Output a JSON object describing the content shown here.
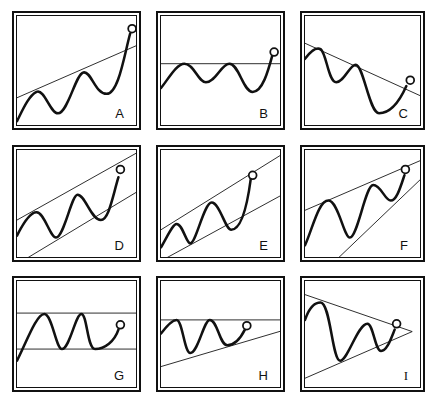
{
  "figure": {
    "colors": {
      "ink": "#111111",
      "background": "#ffffff"
    },
    "viewbox": {
      "w": 128,
      "h": 118
    },
    "panels": [
      {
        "label": "A",
        "x": 12,
        "y": 11,
        "w": 129,
        "h": 119,
        "lines": [
          {
            "x1": 0,
            "y1": 84,
            "x2": 128,
            "y2": 28
          }
        ],
        "curve": "M0,108 C6,96 12,82 20,78 C28,74 34,100 42,100 C52,100 60,60 68,58 C76,56 80,80 92,80 C104,80 110,40 116,18",
        "circle": {
          "cx": 118,
          "cy": 13,
          "r": 4
        }
      },
      {
        "label": "B",
        "x": 156,
        "y": 11,
        "w": 129,
        "h": 119,
        "lines": [
          {
            "x1": 0,
            "y1": 49,
            "x2": 128,
            "y2": 49
          }
        ],
        "curve": "M0,74 C8,64 16,49 24,49 C34,49 38,68 46,68 C56,68 62,49 70,49 C80,49 84,78 94,78 C104,78 110,56 114,41",
        "circle": {
          "cx": 116,
          "cy": 37,
          "r": 4
        }
      },
      {
        "label": "C",
        "x": 300,
        "y": 11,
        "w": 125,
        "h": 119,
        "lines": [
          {
            "x1": 0,
            "y1": 28,
            "x2": 125,
            "y2": 85
          }
        ],
        "curve": "M0,44 C6,36 12,32 16,34 C22,38 24,68 32,68 C40,68 46,50 52,50 C60,50 66,100 76,100 C86,100 96,90 104,72",
        "circle": {
          "cx": 108,
          "cy": 66,
          "r": 4
        }
      },
      {
        "label": "D",
        "x": 12,
        "y": 145,
        "w": 129,
        "h": 117,
        "lines": [
          {
            "x1": 0,
            "y1": 72,
            "x2": 128,
            "y2": 0
          },
          {
            "x1": 4,
            "y1": 115,
            "x2": 128,
            "y2": 40
          }
        ],
        "curve": "M0,88 C6,76 14,64 20,64 C28,64 34,90 40,90 C48,90 56,46 62,46 C70,46 76,72 86,72 C94,72 98,48 104,28",
        "circle": {
          "cx": 106,
          "cy": 20,
          "r": 4
        }
      },
      {
        "label": "E",
        "x": 156,
        "y": 145,
        "w": 129,
        "h": 117,
        "lines": [
          {
            "x1": 0,
            "y1": 82,
            "x2": 128,
            "y2": 2
          },
          {
            "x1": 0,
            "y1": 114,
            "x2": 128,
            "y2": 44
          }
        ],
        "curve": "M0,100 C6,90 12,76 16,76 C22,76 26,96 30,96 C36,96 44,54 52,54 C60,54 66,82 72,82 C82,82 88,60 92,30",
        "circle": {
          "cx": 94,
          "cy": 26,
          "r": 4
        }
      },
      {
        "label": "F",
        "x": 300,
        "y": 145,
        "w": 125,
        "h": 117,
        "lines": [
          {
            "x1": 0,
            "y1": 62,
            "x2": 125,
            "y2": 8
          },
          {
            "x1": 30,
            "y1": 115,
            "x2": 125,
            "y2": 24
          }
        ],
        "curve": "M0,98 C8,80 14,52 24,52 C34,52 40,90 46,90 C54,90 62,36 70,36 C78,36 82,52 88,52 C94,52 98,38 102,26",
        "circle": {
          "cx": 103,
          "cy": 20,
          "r": 4
        }
      },
      {
        "label": "G",
        "x": 12,
        "y": 276,
        "w": 129,
        "h": 116,
        "lines": [
          {
            "x1": 0,
            "y1": 33,
            "x2": 128,
            "y2": 33
          },
          {
            "x1": 0,
            "y1": 70,
            "x2": 128,
            "y2": 70
          }
        ],
        "curve": "M0,82 C10,62 20,34 28,34 C36,34 40,70 46,70 C54,70 60,34 66,34 C72,34 72,70 80,70 C90,70 100,62 104,50",
        "circle": {
          "cx": 106,
          "cy": 45,
          "r": 4
        }
      },
      {
        "label": "H",
        "x": 156,
        "y": 276,
        "w": 129,
        "h": 116,
        "lines": [
          {
            "x1": 0,
            "y1": 40,
            "x2": 128,
            "y2": 40
          },
          {
            "x1": 0,
            "y1": 88,
            "x2": 128,
            "y2": 50
          }
        ],
        "curve": "M0,54 C6,46 12,40 16,40 C22,40 24,74 30,74 C38,74 44,40 50,40 C58,40 60,66 68,66 C76,66 82,58 86,50",
        "circle": {
          "cx": 88,
          "cy": 46,
          "r": 4
        }
      },
      {
        "label": "I",
        "x": 300,
        "y": 276,
        "w": 125,
        "h": 116,
        "lines": [
          {
            "x1": 0,
            "y1": 14,
            "x2": 110,
            "y2": 52
          },
          {
            "x1": 0,
            "y1": 100,
            "x2": 110,
            "y2": 52
          }
        ],
        "curve": "M0,40 C4,28 10,22 16,22 C26,22 28,82 36,82 C44,82 54,44 64,44 C70,44 72,72 78,72 C84,72 88,60 92,50",
        "circle": {
          "cx": 94,
          "cy": 44,
          "r": 4
        }
      }
    ]
  }
}
